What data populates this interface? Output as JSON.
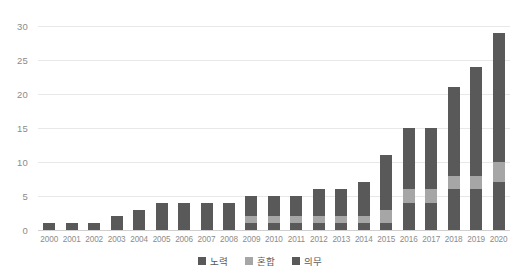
{
  "chart_data": {
    "type": "bar",
    "stacked": true,
    "title": "",
    "subtitle": "",
    "xlabel": "",
    "ylabel": "",
    "ylim": [
      0,
      30
    ],
    "ytick_step": 5,
    "yticks": [
      30,
      25,
      20,
      15,
      10,
      5,
      0
    ],
    "grid": true,
    "legend_position": "bottom-center",
    "categories": [
      "2000",
      "2001",
      "2002",
      "2003",
      "2004",
      "2005",
      "2006",
      "2007",
      "2008",
      "2009",
      "2010",
      "2011",
      "2012",
      "2013",
      "2014",
      "2015",
      "2016",
      "2017",
      "2018",
      "2019",
      "2020"
    ],
    "series": [
      {
        "name": "노력",
        "color": "#595959",
        "values": [
          1,
          1,
          1,
          1,
          1,
          1,
          1,
          1,
          1,
          1,
          1,
          1,
          1,
          1,
          1,
          1,
          4,
          4,
          6,
          6,
          7
        ]
      },
      {
        "name": "혼합",
        "color": "#a6a6a6",
        "values": [
          0,
          0,
          0,
          0,
          0,
          0,
          0,
          0,
          0,
          1,
          1,
          1,
          1,
          1,
          1,
          2,
          2,
          2,
          2,
          2,
          3
        ]
      },
      {
        "name": "의무",
        "color": "#595959",
        "values": [
          0,
          0,
          0,
          1,
          2,
          3,
          3,
          3,
          3,
          3,
          3,
          3,
          4,
          4,
          5,
          8,
          9,
          9,
          13,
          16,
          19
        ]
      }
    ],
    "totals": [
      1,
      1,
      1,
      2,
      3,
      4,
      4,
      4,
      4,
      5,
      5,
      5,
      6,
      6,
      7,
      11,
      15,
      15,
      21,
      24,
      29
    ]
  },
  "legend": {
    "items": [
      {
        "label": "노력",
        "color": "#595959"
      },
      {
        "label": "혼합",
        "color": "#a6a6a6"
      },
      {
        "label": "의무",
        "color": "#595959"
      }
    ]
  },
  "colors": {
    "series_dark": "#595959",
    "series_light": "#a6a6a6",
    "gridline": "#e8e8e8",
    "baseline": "#d0d0d0",
    "axis_text": "#8c8c8c",
    "legend_text": "#595959",
    "background": "#ffffff"
  }
}
